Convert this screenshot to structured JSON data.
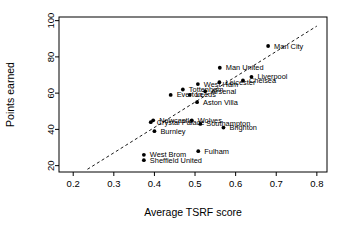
{
  "chart_data": {
    "type": "scatter",
    "title": "",
    "xlabel": "Average TSRF score",
    "ylabel": "Points earned",
    "xlim": [
      0.165,
      0.825
    ],
    "ylim": [
      16.5,
      102
    ],
    "xticks": [
      0.2,
      0.3,
      0.4,
      0.5,
      0.6,
      0.7,
      0.8
    ],
    "xticklabels": [
      "0.2",
      "0.3",
      "0.4",
      "0.5",
      "0.6",
      "0.7",
      "0.8"
    ],
    "yticks": [
      20,
      40,
      60,
      80,
      100
    ],
    "yticklabels": [
      "20",
      "40",
      "60",
      "80",
      "100"
    ],
    "grid": false,
    "legend": "none",
    "points": [
      {
        "label": "Man City",
        "x": 0.68,
        "y": 86,
        "label_dx": 6,
        "label_dy": 2.5
      },
      {
        "label": "Man United",
        "x": 0.561,
        "y": 74,
        "label_dx": 6,
        "label_dy": 2.5
      },
      {
        "label": "Liverpool",
        "x": 0.639,
        "y": 69,
        "label_dx": 6,
        "label_dy": 2.5
      },
      {
        "label": "Chelsea",
        "x": 0.618,
        "y": 67,
        "label_dx": 6,
        "label_dy": 2.5
      },
      {
        "label": "Leicester",
        "x": 0.56,
        "y": 66,
        "label_dx": 6,
        "label_dy": 2.5
      },
      {
        "label": "West Ham",
        "x": 0.507,
        "y": 65,
        "label_dx": 6,
        "label_dy": 2.5
      },
      {
        "label": "Tottenham",
        "x": 0.47,
        "y": 62,
        "label_dx": 6,
        "label_dy": 2.5
      },
      {
        "label": "Arsenal",
        "x": 0.525,
        "y": 61,
        "label_dx": 6,
        "label_dy": 2.5
      },
      {
        "label": "Leeds",
        "x": 0.487,
        "y": 59,
        "label_dx": 6,
        "label_dy": 2.5
      },
      {
        "label": "Everton",
        "x": 0.44,
        "y": 59,
        "label_dx": 6,
        "label_dy": 2.5
      },
      {
        "label": "Aston Villa",
        "x": 0.505,
        "y": 55,
        "label_dx": 6,
        "label_dy": 2.5
      },
      {
        "label": "Newcastle",
        "x": 0.397,
        "y": 45,
        "label_dx": 6,
        "label_dy": 2.5
      },
      {
        "label": "Crystal Palace",
        "x": 0.391,
        "y": 44,
        "label_dx": 6,
        "label_dy": 2.5
      },
      {
        "label": "Wolves",
        "x": 0.492,
        "y": 45,
        "label_dx": 6,
        "label_dy": 2.5
      },
      {
        "label": "Southampton",
        "x": 0.513,
        "y": 43,
        "label_dx": 6,
        "label_dy": 2.5
      },
      {
        "label": "Brighton",
        "x": 0.57,
        "y": 41,
        "label_dx": 6,
        "label_dy": 2.5
      },
      {
        "label": "Burnley",
        "x": 0.4,
        "y": 39,
        "label_dx": 6,
        "label_dy": 2.5
      },
      {
        "label": "Fulham",
        "x": 0.508,
        "y": 28,
        "label_dx": 6,
        "label_dy": 2.5
      },
      {
        "label": "West Brom",
        "x": 0.374,
        "y": 26,
        "label_dx": 6,
        "label_dy": 2.5
      },
      {
        "label": "Sheffield United",
        "x": 0.374,
        "y": 23,
        "label_dx": 6,
        "label_dy": 2.5
      }
    ],
    "trendline": {
      "x0": 0.235,
      "y0": 18,
      "x1": 0.8,
      "y1": 97,
      "style": "dashed"
    }
  }
}
